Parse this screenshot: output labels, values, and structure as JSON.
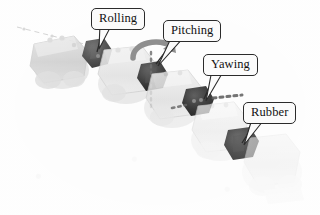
{
  "figure": {
    "background_color": "#fdfdfd",
    "body_color": "#c9c9c9",
    "joint_color": "#2a2a2a",
    "label_border_color": "#2b2b2b",
    "label_fill_color": "#fbfbfb",
    "label_text_color": "#111111",
    "axis_line_color": "#5a5a5a",
    "arrow_color": "#8f8f8f"
  },
  "labels": [
    {
      "id": "rolling",
      "text": "Rolling",
      "box": {
        "x": 91,
        "y": 8,
        "w": 48,
        "h": 18
      },
      "target": {
        "x": 97,
        "y": 53
      },
      "tail": "down-left"
    },
    {
      "id": "pitching",
      "text": "Pitching",
      "box": {
        "x": 163,
        "y": 20,
        "w": 52,
        "h": 18
      },
      "target": {
        "x": 152,
        "y": 62
      },
      "tail": "down-left"
    },
    {
      "id": "yawing",
      "text": "Yawing",
      "box": {
        "x": 203,
        "y": 54,
        "w": 50,
        "h": 18
      },
      "target": {
        "x": 204,
        "y": 100
      },
      "tail": "down-left"
    },
    {
      "id": "rubber",
      "text": "Rubber",
      "box": {
        "x": 243,
        "y": 102,
        "w": 51,
        "h": 19
      },
      "target": {
        "x": 240,
        "y": 144
      },
      "tail": "down-left"
    }
  ],
  "joints": [
    {
      "id": "rolling-joint",
      "x": 97,
      "y": 53,
      "r": 13
    },
    {
      "id": "pitching-joint",
      "x": 152,
      "y": 77,
      "r": 13
    },
    {
      "id": "yawing-joint",
      "x": 197,
      "y": 101,
      "r": 13
    },
    {
      "id": "rubber-joint",
      "x": 240,
      "y": 143,
      "r": 14
    }
  ],
  "axis_lines": [
    {
      "id": "rolling-axis",
      "orientation": "diagonal",
      "style": "dashed"
    },
    {
      "id": "pitching-axis",
      "orientation": "vertical",
      "style": "dotted"
    },
    {
      "id": "yawing-axis",
      "orientation": "horizontal",
      "style": "dotted"
    }
  ],
  "rotation_arrow": {
    "id": "pitching-rotation-arrow",
    "shape": "curved",
    "near_joint": "pitching-joint"
  }
}
